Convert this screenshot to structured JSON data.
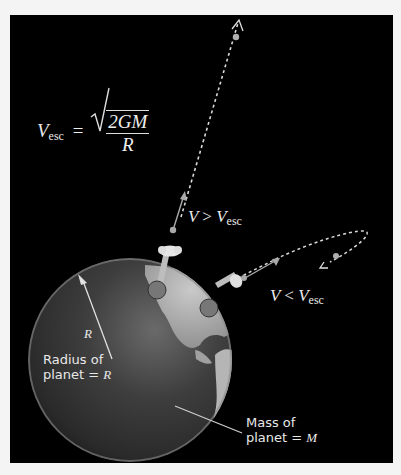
{
  "diagram": {
    "formula": {
      "lhs_symbol": "V",
      "lhs_subscript": "esc",
      "equals": "=",
      "numerator": "2GM",
      "denominator": "R"
    },
    "trajectory_labels": {
      "escape": {
        "symbol": "V",
        "relation": ">",
        "rhs_symbol": "V",
        "rhs_subscript": "esc"
      },
      "orbit": {
        "symbol": "V",
        "relation": "<",
        "rhs_symbol": "V",
        "rhs_subscript": "esc"
      }
    },
    "radius_symbol": "R",
    "radius_label": {
      "line1": "Radius of",
      "line2_prefix": "planet = ",
      "line2_symbol": "R"
    },
    "mass_label": {
      "line1": "Mass of",
      "line2_prefix": "planet = ",
      "line2_symbol": "M"
    },
    "colors": {
      "background": "#000000",
      "page": "#f4f4f4",
      "text": "#e8e8e8",
      "path": "#d8d8d8"
    }
  }
}
